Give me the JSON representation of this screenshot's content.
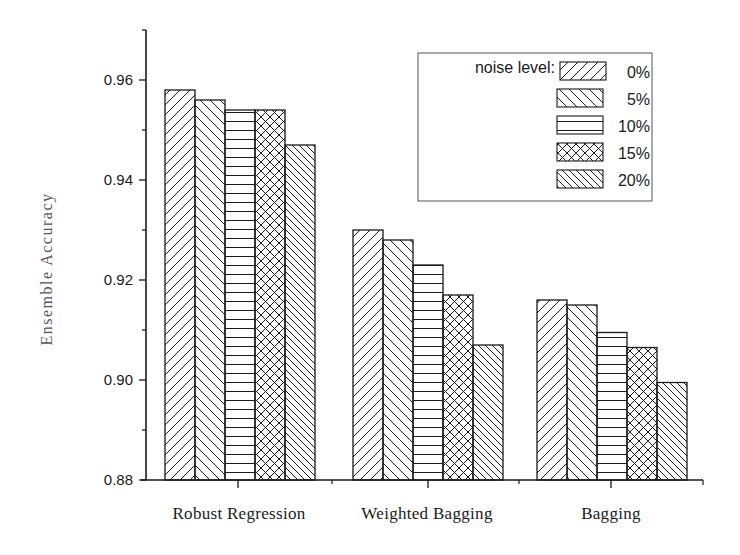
{
  "chart_data": {
    "type": "bar",
    "title": "",
    "xlabel": "",
    "ylabel": "Ensemble    Accuracy",
    "ylim": [
      0.88,
      0.97
    ],
    "yticks": [
      "0.88",
      "0.90",
      "0.92",
      "0.94",
      "0.96"
    ],
    "grid": false,
    "legend_position": "top-right",
    "legend_title": "noise level:",
    "categories": [
      "Robust Regression",
      "Weighted Bagging",
      "Bagging"
    ],
    "series": [
      {
        "name": "0%",
        "pattern": "diagonal-forward",
        "values": [
          0.958,
          0.93,
          0.916
        ]
      },
      {
        "name": "5%",
        "pattern": "diagonal-backward",
        "values": [
          0.956,
          0.928,
          0.915
        ]
      },
      {
        "name": "10%",
        "pattern": "horizontal",
        "values": [
          0.954,
          0.923,
          0.9095
        ]
      },
      {
        "name": "15%",
        "pattern": "crosshatch",
        "values": [
          0.954,
          0.917,
          0.9065
        ]
      },
      {
        "name": "20%",
        "pattern": "diagonal-backward-dense",
        "values": [
          0.947,
          0.907,
          0.8995
        ]
      }
    ]
  },
  "colors": {
    "ink": "#1a1a1a",
    "background": "#ffffff",
    "ylabel": "#555555"
  }
}
